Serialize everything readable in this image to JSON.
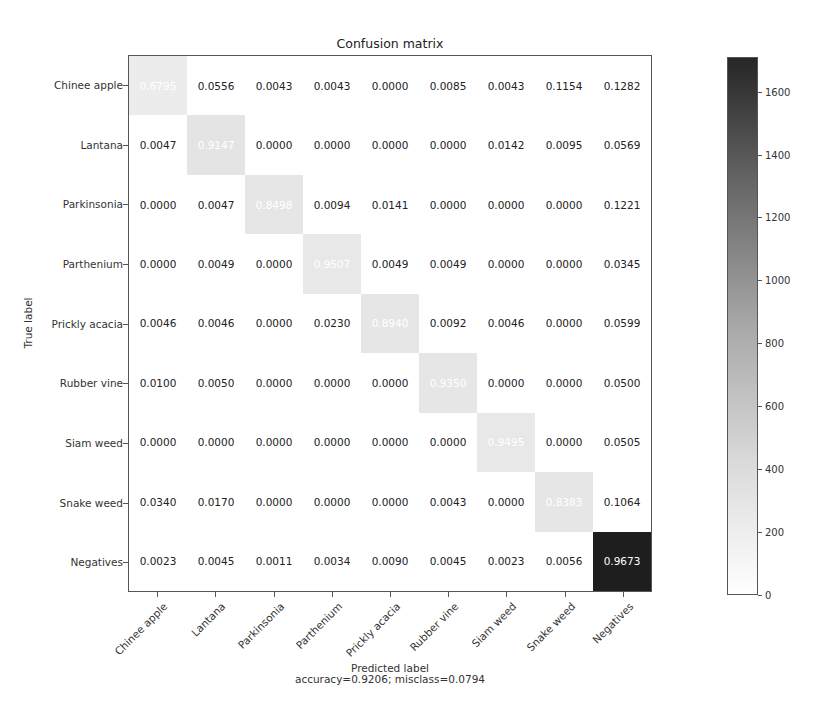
{
  "chart_data": {
    "type": "heatmap",
    "title": "Confusion matrix",
    "xlabel": "Predicted label",
    "xlabel_sub": "accuracy=0.9206; misclass=0.0794",
    "ylabel": "True label",
    "categories": [
      "Chinee apple",
      "Lantana",
      "Parkinsonia",
      "Parthenium",
      "Prickly acacia",
      "Rubber vine",
      "Siam weed",
      "Snake weed",
      "Negatives"
    ],
    "matrix": [
      [
        "0.6795",
        "0.0556",
        "0.0043",
        "0.0043",
        "0.0000",
        "0.0085",
        "0.0043",
        "0.1154",
        "0.1282"
      ],
      [
        "0.0047",
        "0.9147",
        "0.0000",
        "0.0000",
        "0.0000",
        "0.0000",
        "0.0142",
        "0.0095",
        "0.0569"
      ],
      [
        "0.0000",
        "0.0047",
        "0.8498",
        "0.0094",
        "0.0141",
        "0.0000",
        "0.0000",
        "0.0000",
        "0.1221"
      ],
      [
        "0.0000",
        "0.0049",
        "0.0000",
        "0.9507",
        "0.0049",
        "0.0049",
        "0.0000",
        "0.0000",
        "0.0345"
      ],
      [
        "0.0046",
        "0.0046",
        "0.0000",
        "0.0230",
        "0.8940",
        "0.0092",
        "0.0046",
        "0.0000",
        "0.0599"
      ],
      [
        "0.0100",
        "0.0050",
        "0.0000",
        "0.0000",
        "0.0000",
        "0.9350",
        "0.0000",
        "0.0000",
        "0.0500"
      ],
      [
        "0.0000",
        "0.0000",
        "0.0000",
        "0.0000",
        "0.0000",
        "0.0000",
        "0.9495",
        "0.0000",
        "0.0505"
      ],
      [
        "0.0340",
        "0.0170",
        "0.0000",
        "0.0000",
        "0.0000",
        "0.0043",
        "0.0000",
        "0.8383",
        "0.1064"
      ],
      [
        "0.0023",
        "0.0045",
        "0.0011",
        "0.0034",
        "0.0090",
        "0.0045",
        "0.0023",
        "0.0056",
        "0.9673"
      ]
    ],
    "diagonal_shade": [
      "#ececec",
      "#e4e4e4",
      "#e6e6e6",
      "#e8e8e8",
      "#e6e6e6",
      "#e6e6e6",
      "#e8e8e8",
      "#e6e6e6",
      "#1e1e1e"
    ],
    "colorbar": {
      "ticks": [
        "0",
        "200",
        "400",
        "600",
        "800",
        "1000",
        "1200",
        "1400",
        "1600"
      ],
      "max": 1710,
      "cmap": "Greys"
    },
    "accuracy": 0.9206,
    "misclass": 0.0794
  }
}
